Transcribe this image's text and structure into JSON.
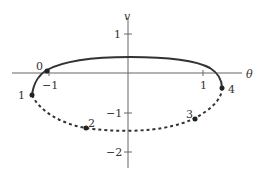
{
  "diagram": {
    "type": "phase-portrait",
    "axes": {
      "x_label": "θ",
      "y_label": "v",
      "x_ticks": [
        {
          "value": -1,
          "label": "−1"
        },
        {
          "value": 1,
          "label": "1"
        }
      ],
      "y_ticks": [
        {
          "value": 1,
          "label": "1"
        },
        {
          "value": -1,
          "label": "−1"
        },
        {
          "value": -2,
          "label": "−2"
        }
      ]
    },
    "curves": [
      {
        "name": "upper-solid",
        "style": "solid",
        "description": "solid arc from point 0 over v≈0.4 to point 4"
      },
      {
        "name": "lower-dashed",
        "style": "dashed",
        "description": "dashed arc from point 1 through points 2,3 down to v≈−1.5 and up to point 4"
      }
    ],
    "points": [
      {
        "label": "0",
        "theta": -1.0,
        "v": 0.0
      },
      {
        "label": "1",
        "theta": -1.2,
        "v": -0.55
      },
      {
        "label": "2",
        "theta": -0.5,
        "v": -1.4
      },
      {
        "label": "3",
        "theta": 0.9,
        "v": -1.2
      },
      {
        "label": "4",
        "theta": 1.25,
        "v": -0.4
      }
    ],
    "colors": {
      "curve": "#333333",
      "axis": "#555555"
    }
  }
}
